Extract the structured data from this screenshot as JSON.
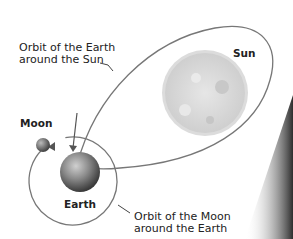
{
  "diagram": {
    "labels": {
      "earth_orbit_line1": "Orbit of the Earth",
      "earth_orbit_line2": "around the Sun",
      "sun": "Sun",
      "moon": "Moon",
      "earth": "Earth",
      "moon_orbit_line1": "Orbit of the Moon",
      "moon_orbit_line2": "around the Earth"
    },
    "colors": {
      "orbit_line": "#777777",
      "sun": "#d8d8d8",
      "earth": "#7a7a7a",
      "moon": "#808080",
      "shadow": "#333333"
    }
  }
}
